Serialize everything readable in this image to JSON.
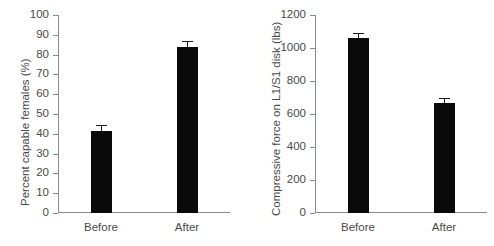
{
  "figure": {
    "background": "#ffffff",
    "bar_color": "#0a0a0a",
    "axis_color": "#8a8a8a",
    "text_color": "#4a4a4a"
  },
  "chart_data": [
    {
      "type": "bar",
      "panel": "left",
      "title": "",
      "xlabel": "",
      "ylabel": "Percent capable females (%)",
      "categories": [
        "Before",
        "After"
      ],
      "values": [
        41.5,
        84
      ],
      "errors": [
        3,
        3
      ],
      "ylim": [
        0,
        100
      ],
      "yticks": [
        0,
        10,
        20,
        30,
        40,
        50,
        60,
        70,
        80,
        90,
        100
      ],
      "ytick_labels": [
        "0",
        "10",
        "20",
        "30",
        "40",
        "50",
        "60",
        "70",
        "80",
        "90",
        "100"
      ],
      "grid": false,
      "legend": "none"
    },
    {
      "type": "bar",
      "panel": "right",
      "title": "",
      "xlabel": "",
      "ylabel": "Compressive force on L1/S1 disk (lbs)",
      "categories": [
        "Before",
        "After"
      ],
      "values": [
        1060,
        668
      ],
      "errors": [
        30,
        30
      ],
      "ylim": [
        0,
        1200
      ],
      "yticks": [
        0,
        200,
        400,
        600,
        800,
        1000,
        1200
      ],
      "ytick_labels": [
        "0",
        "200",
        "400",
        "600",
        "800",
        "1000",
        "1200"
      ],
      "grid": false,
      "legend": "none"
    }
  ]
}
